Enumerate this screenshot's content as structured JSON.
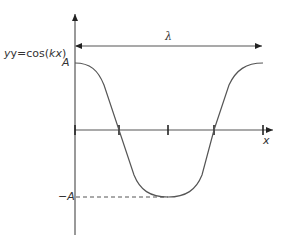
{
  "diagram": {
    "equation_prefix": "y=cos(",
    "equation_k": "kx",
    "equation_suffix": ")",
    "amplitude_label": "A",
    "neg_amplitude_label": "−A",
    "wavelength_label": "λ",
    "x_axis_label": "x",
    "colors": {
      "line": "#555555",
      "text": "#333333"
    }
  }
}
